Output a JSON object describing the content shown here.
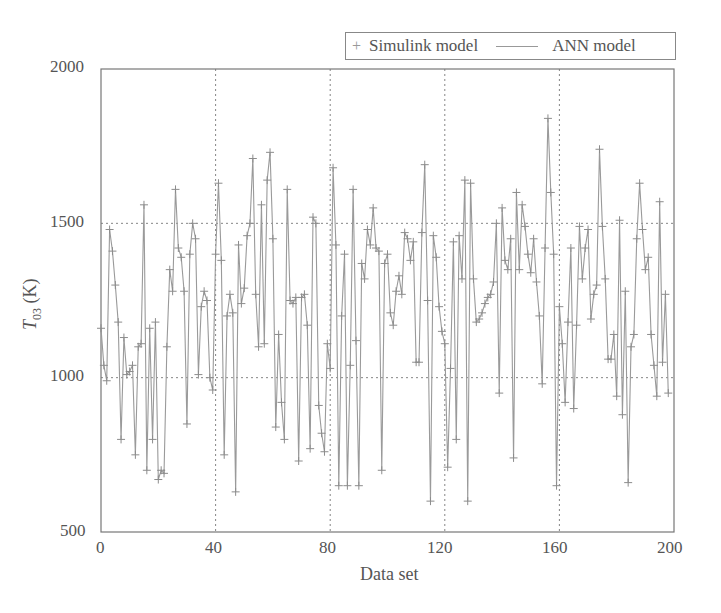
{
  "legend": {
    "series1_label": "Simulink model",
    "series2_label": "ANN model"
  },
  "axes": {
    "xlabel": "Data set",
    "ylabel_main": "T",
    "ylabel_sub": "03",
    "ylabel_unit": " (K)",
    "xticks": [
      "0",
      "40",
      "80",
      "120",
      "160",
      "200"
    ],
    "yticks": [
      "2000",
      "1500",
      "1000",
      "500"
    ]
  },
  "colors": {
    "line": "#9a9a9a",
    "marker": "#8c8c8c",
    "grid": "#777777",
    "axis": "#777777"
  },
  "chart_data": {
    "type": "line",
    "title": "",
    "xlabel": "Data set",
    "ylabel": "T03 (K)",
    "xlim": [
      0,
      200
    ],
    "ylim": [
      500,
      2000
    ],
    "xticks": [
      0,
      40,
      80,
      120,
      160,
      200
    ],
    "yticks": [
      500,
      1000,
      1500,
      2000
    ],
    "grid": true,
    "grid_style": "dotted",
    "legend_position": "top-right, outside above plot",
    "series": [
      {
        "name": "Simulink model",
        "style": "markers (+)",
        "values": [
          1160,
          1040,
          990,
          1480,
          1410,
          1300,
          1180,
          800,
          1130,
          1010,
          1020,
          1040,
          750,
          1100,
          1110,
          1560,
          700,
          1160,
          800,
          1180,
          670,
          700,
          690,
          1100,
          1350,
          1280,
          1610,
          1420,
          1390,
          1280,
          850,
          1400,
          1500,
          1450,
          1010,
          1230,
          1280,
          1250,
          1000,
          960,
          1400,
          1630,
          1380,
          750,
          1200,
          1270,
          1210,
          630,
          1430,
          1240,
          1290,
          1460,
          1500,
          1710,
          1270,
          1100,
          1560,
          1110,
          1640,
          1730,
          1450,
          840,
          1140,
          920,
          800,
          1610,
          1250,
          1240,
          1260,
          730,
          1260,
          1270,
          1170,
          770,
          1520,
          1500,
          910,
          820,
          760,
          1110,
          1030,
          1680,
          1430,
          650,
          1200,
          1400,
          650,
          1040,
          1610,
          1120,
          650,
          1370,
          1320,
          1480,
          1430,
          1550,
          1420,
          1410,
          700,
          1370,
          1400,
          1210,
          1170,
          1280,
          1330,
          1270,
          1470,
          1450,
          1380,
          1440,
          1050,
          1050,
          1470,
          1690,
          1250,
          600,
          1460,
          1390,
          1230,
          1150,
          1110,
          710,
          1030,
          1440,
          800,
          1460,
          1320,
          1640,
          600,
          1630,
          1320,
          1180,
          1190,
          1210,
          1240,
          1260,
          1270,
          1310,
          1500,
          950,
          1550,
          1380,
          1350,
          1450,
          740,
          1600,
          1350,
          1560,
          1490,
          1400,
          1340,
          1450,
          1310,
          1200,
          980,
          1420,
          1840,
          1600,
          1400,
          650,
          1230,
          1110,
          920,
          1180,
          1420,
          900,
          1170,
          1490,
          1320,
          1420,
          1480,
          1190,
          1270,
          1300,
          1740,
          1490,
          1320,
          1060,
          1060,
          1140,
          940,
          1510,
          880,
          1280,
          660,
          1100,
          1140,
          1450,
          1630,
          1480,
          1350,
          1390,
          1140,
          1040,
          940,
          1570,
          1050,
          1270,
          950
        ]
      },
      {
        "name": "ANN model",
        "style": "solid line",
        "values": "same as Simulink model (overlapping)"
      }
    ]
  }
}
